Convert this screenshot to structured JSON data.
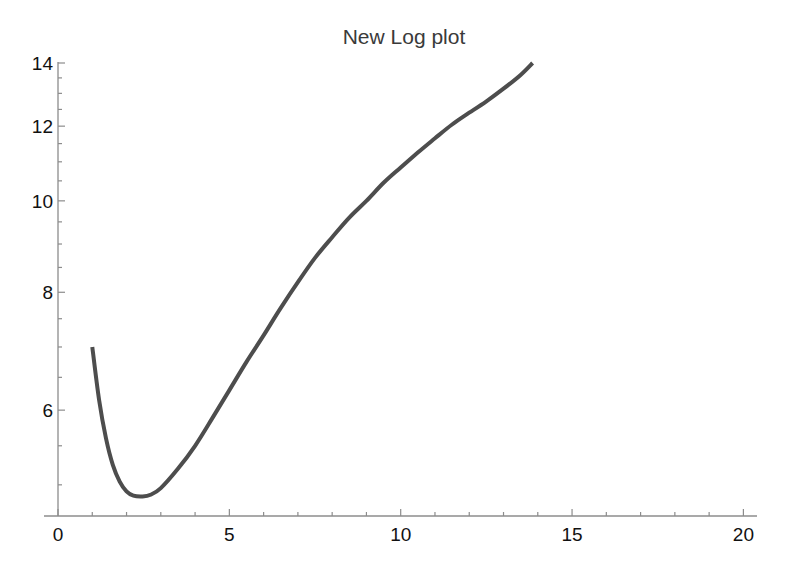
{
  "chart_data": {
    "type": "line",
    "title": "New Log plot",
    "xlabel": "",
    "ylabel": "",
    "y_scale": "log",
    "xlim": [
      0,
      20.8
    ],
    "ylim": [
      4.63,
      14
    ],
    "grid": false,
    "legend": null,
    "x_ticks": [
      0,
      5,
      10,
      15,
      20
    ],
    "x_tick_labels": [
      "0",
      "5",
      "10",
      "15",
      "20"
    ],
    "x_minor_step": 1,
    "y_ticks": [
      6,
      8,
      10,
      12,
      14
    ],
    "y_tick_labels": [
      "6",
      "8",
      "10",
      "12",
      "14"
    ],
    "y_minor_ticks": [
      5,
      5.5,
      6.5,
      7,
      7.5,
      8.5,
      9,
      9.5,
      10.5,
      11,
      11.5,
      12.5,
      13,
      13.5
    ],
    "series": [
      {
        "name": "curve",
        "color": "#4d4d4d",
        "x": [
          1.0,
          1.2,
          1.4,
          1.6,
          1.8,
          2.0,
          2.2,
          2.45,
          2.7,
          3.0,
          3.5,
          4.0,
          4.5,
          5.0,
          5.5,
          6.0,
          6.5,
          7.0,
          7.5,
          8.0,
          8.5,
          9.0,
          9.5,
          10.0,
          10.5,
          11.0,
          11.5,
          12.0,
          12.5,
          13.0,
          13.5,
          13.85
        ],
        "values": [
          7.0,
          6.15,
          5.6,
          5.25,
          5.04,
          4.92,
          4.87,
          4.86,
          4.88,
          4.96,
          5.2,
          5.5,
          5.88,
          6.3,
          6.75,
          7.2,
          7.7,
          8.2,
          8.7,
          9.15,
          9.6,
          10.0,
          10.45,
          10.85,
          11.25,
          11.65,
          12.05,
          12.4,
          12.75,
          13.15,
          13.6,
          14.0
        ]
      }
    ]
  },
  "layout": {
    "plot_left": 58,
    "plot_right": 757,
    "x_zero_px": 58,
    "x_px_per_unit": 34.27,
    "y_top_px": 63,
    "y_bottom_px": 516,
    "y_px_per_ln": 409.7,
    "title_x": 404,
    "title_y": 44
  }
}
